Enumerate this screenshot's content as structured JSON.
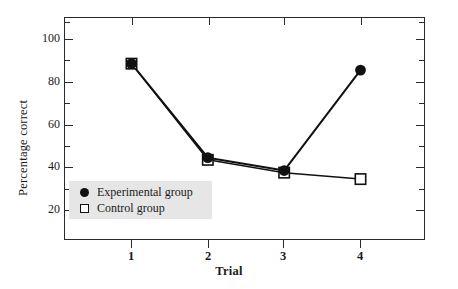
{
  "chart_data": {
    "type": "line",
    "title": "",
    "xlabel": "Trial",
    "ylabel": "Percentage correct",
    "categories": [
      "1",
      "2",
      "3",
      "4"
    ],
    "x": [
      1,
      2,
      3,
      4
    ],
    "xlim": [
      0.35,
      4.65
    ],
    "ylim": [
      11,
      112
    ],
    "grid": false,
    "legend_position": "lower left inside plot",
    "y_major_ticks": [
      100,
      80,
      60,
      40,
      20
    ],
    "y_minor_ticks": [
      110,
      90,
      70,
      50,
      30
    ],
    "y_tick_labels": [
      "100",
      "80",
      "60",
      "40",
      "20"
    ],
    "x_tick_labels": [
      "1",
      "2",
      "3",
      "4"
    ],
    "series": [
      {
        "name": "Experimental group",
        "marker": "filled-circle",
        "color": "#111111",
        "values": [
          88,
          44,
          38,
          85
        ]
      },
      {
        "name": "Control group",
        "marker": "open-square",
        "color": "#111111",
        "values": [
          88,
          43,
          37,
          34
        ]
      }
    ]
  },
  "axes": {
    "ylabel": "Percentage correct",
    "xlabel": "Trial",
    "y_tick_labels": [
      "100",
      "80",
      "60",
      "40",
      "20"
    ],
    "x_tick_labels": [
      "1",
      "2",
      "3",
      "4"
    ]
  },
  "legend": {
    "items": [
      {
        "label": "Experimental group",
        "marker": "filled-circle"
      },
      {
        "label": "Control group",
        "marker": "open-square"
      }
    ],
    "background_color": "#e6e6e6"
  },
  "colors": {
    "axis": "#2b2b2b",
    "series": "#111111",
    "legend_bg": "#e6e6e6",
    "page_bg": "#ffffff"
  }
}
